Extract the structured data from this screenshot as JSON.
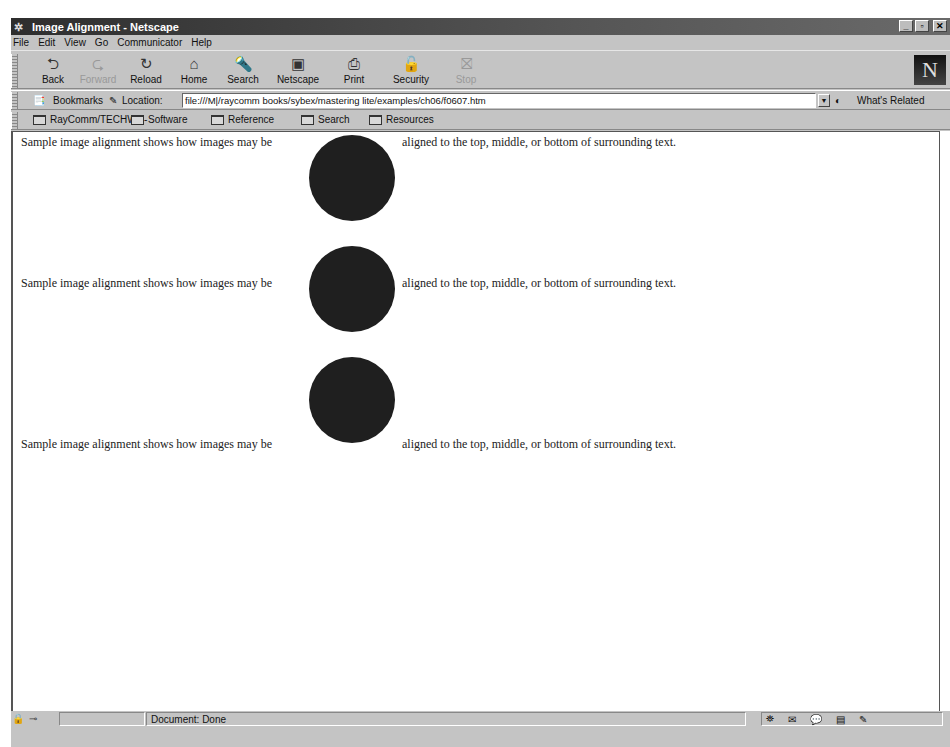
{
  "window": {
    "title": "Image Alignment - Netscape",
    "controls": [
      "minimize",
      "maximize",
      "close"
    ]
  },
  "menubar": [
    "File",
    "Edit",
    "View",
    "Go",
    "Communicator",
    "Help"
  ],
  "navigation_toolbar": {
    "buttons": [
      {
        "label": "Back",
        "icon": "back-arrow-icon",
        "enabled": true
      },
      {
        "label": "Forward",
        "icon": "forward-arrow-icon",
        "enabled": false
      },
      {
        "label": "Reload",
        "icon": "reload-icon",
        "enabled": true
      },
      {
        "label": "Home",
        "icon": "home-icon",
        "enabled": true
      },
      {
        "label": "Search",
        "icon": "search-icon",
        "enabled": true
      },
      {
        "label": "Netscape",
        "icon": "netscape-icon",
        "enabled": true
      },
      {
        "label": "Print",
        "icon": "print-icon",
        "enabled": true
      },
      {
        "label": "Security",
        "icon": "lock-icon",
        "enabled": true
      },
      {
        "label": "Stop",
        "icon": "stop-icon",
        "enabled": false
      }
    ],
    "logo": "N"
  },
  "location_toolbar": {
    "bookmarks_label": "Bookmarks",
    "location_label": "Location:",
    "url": "file:///M|/raycomm books/sybex/mastering lite/examples/ch06/f0607.htm",
    "whats_related": "What's Related"
  },
  "personal_toolbar": [
    "RayComm/TECHWR-",
    "Software",
    "Reference",
    "Search",
    "Resources"
  ],
  "page": {
    "rows": [
      {
        "align": "top",
        "before": "Sample image alignment shows how images may be",
        "after": "aligned to the top, middle, or bottom of surrounding text."
      },
      {
        "align": "middle",
        "before": "Sample image alignment shows how images may be",
        "after": "aligned to the top, middle, or bottom of surrounding text."
      },
      {
        "align": "bottom",
        "before": "Sample image alignment shows how images may be",
        "after": "aligned to the top, middle, or bottom of surrounding text."
      }
    ],
    "image_color": "#1f1f1f"
  },
  "statusbar": {
    "status": "Document: Done"
  }
}
